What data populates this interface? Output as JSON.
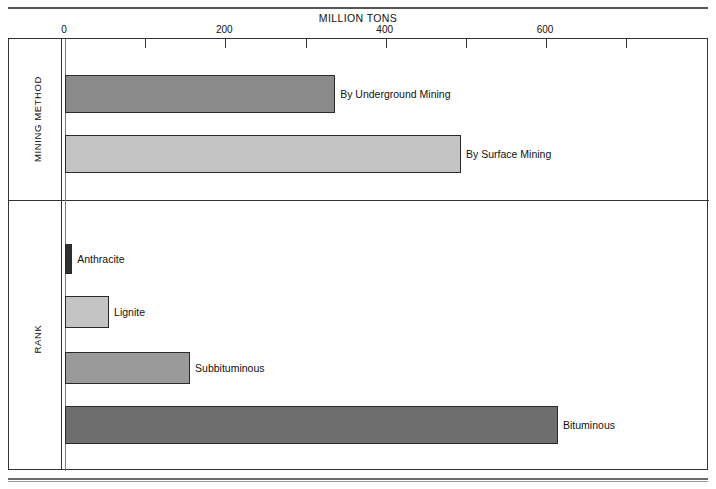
{
  "figure": {
    "axis_title": "MILLION TONS",
    "caption": ""
  },
  "groups": [
    {
      "label": "MINING METHOD"
    },
    {
      "label": "RANK"
    }
  ],
  "chart_data": {
    "type": "bar",
    "orientation": "horizontal",
    "title": "",
    "xlabel": "MILLION TONS",
    "ylabel": "",
    "xlim": [
      0,
      700
    ],
    "xticks": [
      0,
      100,
      200,
      300,
      400,
      500,
      600,
      700
    ],
    "xtick_labels": [
      "0",
      "",
      "200",
      "",
      "400",
      "",
      "600",
      ""
    ],
    "grid": false,
    "legend": "none",
    "panels": [
      {
        "name": "MINING METHOD",
        "categories": [
          "By Underground Mining",
          "By Surface Mining"
        ],
        "values": [
          337,
          494
        ],
        "colors": [
          "#8a8a8a",
          "#c4c4c4"
        ]
      },
      {
        "name": "RANK",
        "categories": [
          "Anthracite",
          "Lignite",
          "Subbituminous",
          "Bituminous"
        ],
        "values": [
          9,
          55,
          156,
          615
        ],
        "colors": [
          "#2f2f2f",
          "#c4c4c4",
          "#9a9a9a",
          "#6e6e6e"
        ]
      }
    ]
  },
  "ticks": [
    {
      "value": 0,
      "label": "0"
    },
    {
      "value": 100,
      "label": ""
    },
    {
      "value": 200,
      "label": "200"
    },
    {
      "value": 300,
      "label": ""
    },
    {
      "value": 400,
      "label": "400"
    },
    {
      "value": 500,
      "label": ""
    },
    {
      "value": 600,
      "label": "600"
    },
    {
      "value": 700,
      "label": ""
    }
  ]
}
